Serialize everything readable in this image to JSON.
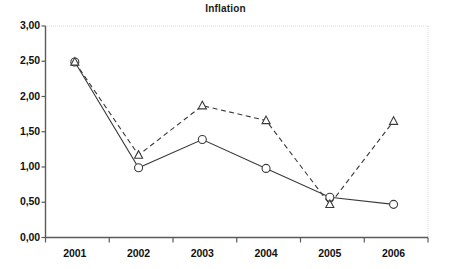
{
  "chart_data": {
    "type": "line",
    "title": "Inflation",
    "xlabel": "",
    "ylabel": "",
    "categories": [
      "2001",
      "2002",
      "2003",
      "2004",
      "2005",
      "2006"
    ],
    "series": [
      {
        "name": "series-solid-circle",
        "marker": "circle",
        "line_style": "solid",
        "color": "#3a3a3a",
        "values": [
          2.49,
          0.99,
          1.39,
          0.98,
          0.57,
          0.47
        ]
      },
      {
        "name": "series-dashed-triangle",
        "marker": "triangle",
        "line_style": "dashed",
        "color": "#3a3a3a",
        "values": [
          2.49,
          1.17,
          1.87,
          1.66,
          0.47,
          1.65
        ]
      }
    ],
    "ylim": [
      0,
      3
    ],
    "ytick_labels": [
      "0,00",
      "0,50",
      "1,00",
      "1,50",
      "2,00",
      "2,50",
      "3,00"
    ],
    "ytick_values": [
      0,
      0.5,
      1,
      1.5,
      2,
      2.5,
      3
    ],
    "grid": false,
    "legend": "none",
    "decimal_separator": ","
  }
}
